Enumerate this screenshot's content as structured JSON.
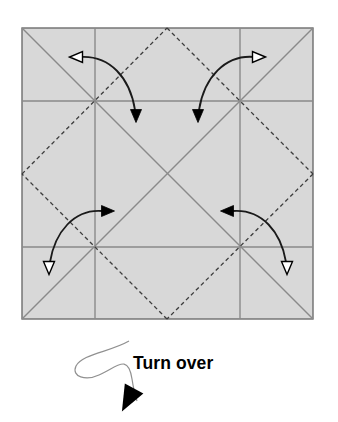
{
  "figure": {
    "kind": "origami-crease-diagram",
    "caption": "Turn over",
    "background_color": "#ffffff",
    "paper": {
      "fill_color": "#d8d8d8",
      "border_color": "#6e6e6e",
      "border_width": 1.4,
      "left": 22,
      "top": 28,
      "size": 291
    },
    "crease_styles": {
      "solid_color": "#8a8a8a",
      "solid_width": 1.4,
      "dashed_color": "#3c3c3c",
      "dashed_width": 1.3,
      "dash_pattern": "4 3"
    },
    "creases": {
      "solid_diagonals": [
        {
          "name": "diagonal-tl-br",
          "x1": 22,
          "y1": 28,
          "x2": 313,
          "y2": 319
        },
        {
          "name": "diagonal-tr-bl",
          "x1": 313,
          "y1": 28,
          "x2": 22,
          "y2": 319
        }
      ],
      "solid_grid": [
        {
          "name": "vertical-quarter-left",
          "x1": 95,
          "y1": 28,
          "x2": 95,
          "y2": 319
        },
        {
          "name": "vertical-quarter-right",
          "x1": 240,
          "y1": 28,
          "x2": 240,
          "y2": 319
        },
        {
          "name": "horizontal-quarter-top",
          "x1": 22,
          "y1": 101,
          "x2": 313,
          "y2": 101
        },
        {
          "name": "horizontal-quarter-bottom",
          "x1": 22,
          "y1": 247,
          "x2": 313,
          "y2": 247
        }
      ],
      "dashed_diamond": [
        {
          "name": "diamond-top-to-right",
          "x1": 167,
          "y1": 28,
          "x2": 313,
          "y2": 174
        },
        {
          "name": "diamond-right-to-bottom",
          "x1": 313,
          "y1": 174,
          "x2": 167,
          "y2": 319
        },
        {
          "name": "diamond-bottom-to-left",
          "x1": 167,
          "y1": 319,
          "x2": 22,
          "y2": 174
        },
        {
          "name": "diamond-left-to-top",
          "x1": 22,
          "y1": 174,
          "x2": 167,
          "y2": 28
        }
      ]
    },
    "fold_arrows": [
      {
        "name": "fold-arrow-top-left",
        "path": "M 80 57 C 110 55 130 78 135 110",
        "tail_head": {
          "type": "hollow",
          "x": 76,
          "y": 57,
          "angle": 180
        },
        "tip_head": {
          "type": "solid",
          "x": 136,
          "y": 116,
          "angle": 90
        }
      },
      {
        "name": "fold-arrow-top-right",
        "path": "M 255 57 C 225 54 204 78 199 110",
        "tail_head": {
          "type": "hollow",
          "x": 259,
          "y": 57,
          "angle": 0
        },
        "tip_head": {
          "type": "solid",
          "x": 198,
          "y": 116,
          "angle": 90
        }
      },
      {
        "name": "fold-arrow-bottom-left",
        "path": "M 102 211 C 74 209 55 232 50 262",
        "tail_head": {
          "type": "solid",
          "x": 108,
          "y": 211,
          "angle": 0
        },
        "tip_head": {
          "type": "hollow",
          "x": 49,
          "y": 268,
          "angle": 90
        }
      },
      {
        "name": "fold-arrow-bottom-right",
        "path": "M 233 211 C 262 209 281 232 286 262",
        "tail_head": {
          "type": "solid",
          "x": 227,
          "y": 211,
          "angle": 180
        },
        "tip_head": {
          "type": "hollow",
          "x": 287,
          "y": 268,
          "angle": 90
        }
      }
    ],
    "turn_over_symbol": {
      "name": "turn-over-loop-arrow",
      "loop_path": "M 129 341 C 110 352 82 354 76 366 C 71 377 86 381 99 375 C 117 367 128 353 132 379 C 134 392 136 398 137 401",
      "loop_color": "#909090",
      "loop_width": 1.2,
      "arrowhead": {
        "type": "solid",
        "x": 128,
        "y": 400,
        "angle": 118
      }
    }
  }
}
